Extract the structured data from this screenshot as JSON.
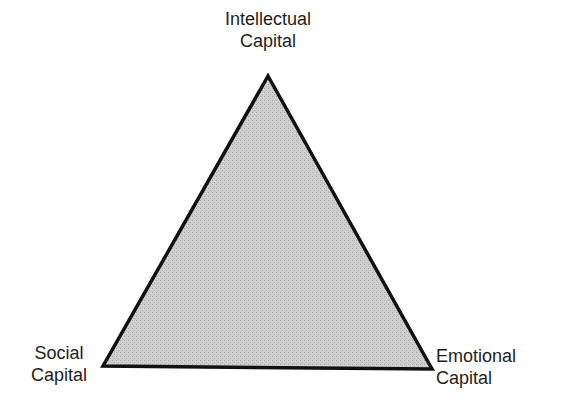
{
  "diagram": {
    "type": "triangle",
    "colors": {
      "fill": "#c8c8c8",
      "stroke": "#111111",
      "background": "#ffffff"
    },
    "vertices": {
      "top": {
        "x": 268,
        "y": 76
      },
      "bottom_left": {
        "x": 103,
        "y": 366
      },
      "bottom_right": {
        "x": 432,
        "y": 369
      }
    },
    "labels": {
      "top": {
        "line1": "Intellectual",
        "line2": "Capital"
      },
      "bottom_left": {
        "line1": "Social",
        "line2": "Capital"
      },
      "bottom_right": {
        "line1": "Emotional",
        "line2": "Capital"
      }
    }
  }
}
